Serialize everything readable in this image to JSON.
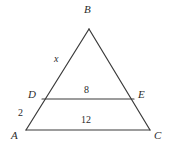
{
  "figure": {
    "stroke_color": "#3a3a3a",
    "background_color": "#ffffff",
    "vertices": [
      {
        "name": "A",
        "label": "A",
        "x": 26,
        "y": 130
      },
      {
        "name": "B",
        "label": "B",
        "x": 89,
        "y": 29
      },
      {
        "name": "C",
        "label": "C",
        "x": 150,
        "y": 130
      },
      {
        "name": "D",
        "label": "D",
        "x": 42,
        "y": 99
      },
      {
        "name": "E",
        "label": "E",
        "x": 134,
        "y": 99
      }
    ],
    "segments": [
      {
        "name": "side-AB",
        "from": "A",
        "to": "B"
      },
      {
        "name": "side-BC",
        "from": "B",
        "to": "C"
      },
      {
        "name": "side-AC",
        "from": "A",
        "to": "C"
      },
      {
        "name": "segment-DE",
        "from": "D",
        "to": "E"
      }
    ],
    "measures": [
      {
        "name": "length-DB",
        "label": "x",
        "segment": "DB",
        "style": "variable"
      },
      {
        "name": "length-AD",
        "label": "2",
        "segment": "AD",
        "style": "number"
      },
      {
        "name": "length-DE",
        "label": "8",
        "segment": "DE",
        "style": "number"
      },
      {
        "name": "length-AC",
        "label": "12",
        "segment": "AC",
        "style": "number"
      }
    ]
  }
}
